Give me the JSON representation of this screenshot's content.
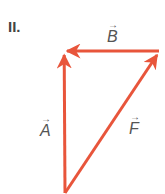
{
  "diagram": {
    "label": "II.",
    "vector_color": "#e8553b",
    "vectors": [
      {
        "name": "A",
        "label": "A",
        "from": [
          65,
          193
        ],
        "to": [
          64,
          52
        ]
      },
      {
        "name": "B",
        "label": "B",
        "from": [
          159,
          51
        ],
        "to": [
          64,
          51
        ]
      },
      {
        "name": "F",
        "label": "F",
        "from": [
          65,
          193
        ],
        "to": [
          159,
          52
        ]
      }
    ]
  }
}
